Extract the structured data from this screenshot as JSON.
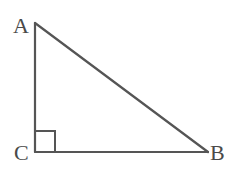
{
  "diagram": {
    "type": "right-triangle",
    "vertices": [
      {
        "label": "A",
        "x": 35,
        "y": 23,
        "label_x": 13,
        "label_y": 33
      },
      {
        "label": "C",
        "x": 35,
        "y": 152,
        "label_x": 14,
        "label_y": 160
      },
      {
        "label": "B",
        "x": 208,
        "y": 152,
        "label_x": 210,
        "label_y": 160
      }
    ],
    "edges": [
      {
        "from": "A",
        "to": "C"
      },
      {
        "from": "C",
        "to": "B"
      },
      {
        "from": "A",
        "to": "B"
      }
    ],
    "right_angle": {
      "at": "C",
      "size": 20
    },
    "stroke_color": "#555555",
    "label_color": "#4a4a4a"
  }
}
